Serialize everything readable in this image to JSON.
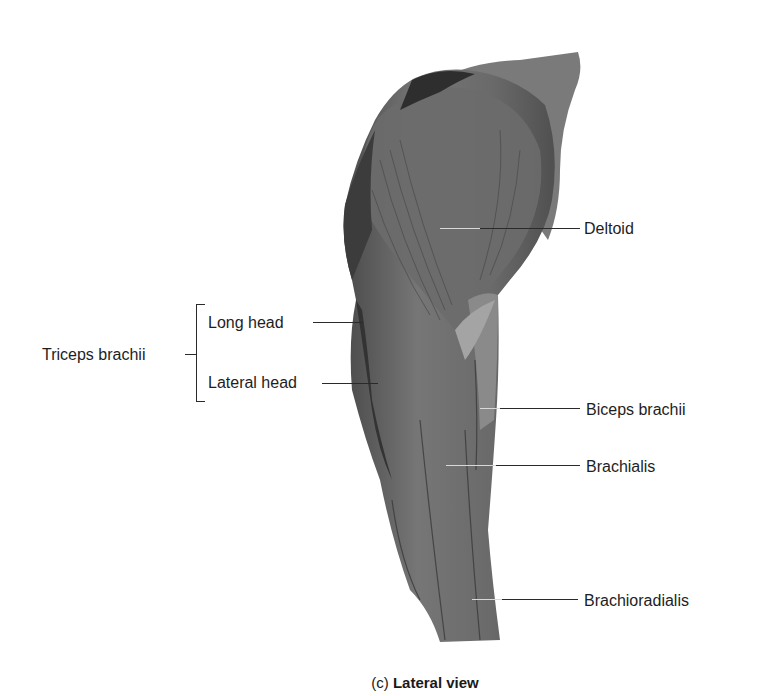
{
  "figure": {
    "labels": {
      "deltoid": "Deltoid",
      "triceps_group": "Triceps brachii",
      "long_head": "Long head",
      "lateral_head": "Lateral head",
      "biceps": "Biceps brachii",
      "brachialis": "Brachialis",
      "brachioradialis": "Brachioradialis"
    },
    "caption": {
      "letter": "(c)",
      "title": "Lateral view"
    },
    "colors": {
      "muscle_base": "#6e6e6e",
      "muscle_dark": "#3a3a3a",
      "muscle_light": "#9a9a9a",
      "line": "#2a2a2a",
      "background": "#ffffff"
    }
  }
}
